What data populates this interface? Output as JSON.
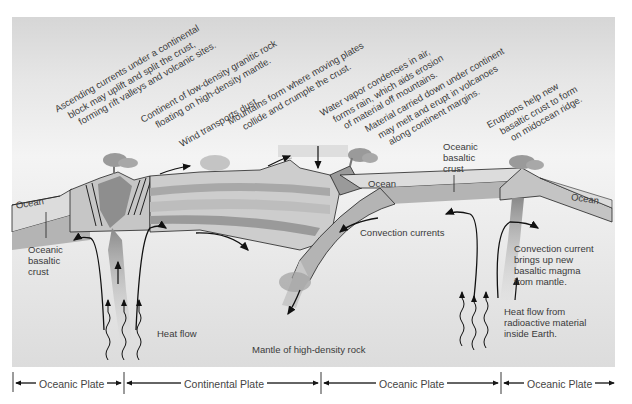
{
  "annotations": {
    "ascending": [
      "Ascending currents under a continental",
      "block may uplift and split the crust,",
      "forming rift valleys and volcanic sites."
    ],
    "continent": [
      "Continent of low-density granitic rock",
      "floating on high-density mantle."
    ],
    "wind": [
      "Wind transports dust."
    ],
    "mountains": [
      "Mountains form where moving plates",
      "collide and crumple the crust."
    ],
    "water": [
      "Water vapor condenses in air,",
      "forms rain, which aids erosion",
      "of material off mountains."
    ],
    "material": [
      "Material carried down under continent",
      "may melt and erupt in volcanoes",
      "along continent margins."
    ],
    "eruptions": [
      "Eruptions help new",
      "basaltic crust to form",
      "on midocean ridge."
    ]
  },
  "labels": {
    "ocean_left": "Ocean",
    "ocean_middle": "Ocean",
    "ocean_right": "Ocean",
    "oceanic_crust_left": [
      "Oceanic",
      "basaltic",
      "crust"
    ],
    "oceanic_crust_right": [
      "Oceanic",
      "basaltic",
      "crust"
    ],
    "convection_currents": "Convection currents",
    "convection_current_right": [
      "Convection current",
      "brings up new",
      "basaltic magma",
      "from mantle."
    ],
    "heat_flow": "Heat flow",
    "heat_flow_right": [
      "Heat flow from",
      "radioactive material",
      "inside Earth."
    ],
    "mantle": "Mantle of high-density rock"
  },
  "plates": [
    {
      "label": "Oceanic Plate",
      "x_start": 13,
      "x_end": 124
    },
    {
      "label": "Continental Plate",
      "x_start": 124,
      "x_end": 321
    },
    {
      "label": "Oceanic Plate",
      "x_start": 321,
      "x_end": 501
    },
    {
      "label": "Oceanic Plate",
      "x_start": 501,
      "x_end": 615
    }
  ],
  "colors": {
    "background": "#ffffff",
    "panel": "#e6e6e6",
    "ocean": "#dcdcdc",
    "crust": "#a8a8a8",
    "strata_light": "#c4c4c4",
    "strata_dark": "#9a9a9a",
    "magma": "#8a8a8a",
    "line": "#111111",
    "text": "#3a3a3a"
  }
}
